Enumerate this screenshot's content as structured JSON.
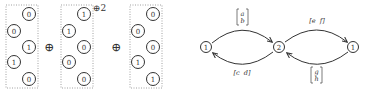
{
  "left_diagram": {
    "columns": [
      {
        "values": [
          "0",
          "0",
          "1",
          "1",
          "0"
        ]
      },
      {
        "values": [
          "1",
          "1",
          "0",
          "0",
          "0"
        ],
        "annotation": "⊕2"
      },
      {
        "values": [
          "0",
          "0",
          "0",
          "1",
          "1"
        ]
      }
    ],
    "operators": [
      "⊕",
      "⊕"
    ]
  },
  "right_diagram": {
    "nodes": [
      {
        "label": "1"
      },
      {
        "label": "2"
      },
      {
        "label": "1"
      }
    ],
    "edges": [
      {
        "from": 0,
        "to": 1,
        "label_top": "a",
        "label_bottom": "b",
        "type": "column-vector"
      },
      {
        "from": 1,
        "to": 0,
        "label": "[c  d]",
        "type": "row-vector"
      },
      {
        "from": 1,
        "to": 2,
        "label": "[e  f]",
        "type": "row-vector"
      },
      {
        "from": 2,
        "to": 1,
        "label_top": "g",
        "label_bottom": "h",
        "type": "column-vector"
      }
    ]
  }
}
